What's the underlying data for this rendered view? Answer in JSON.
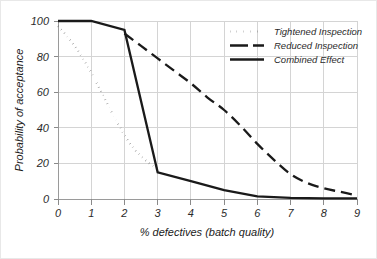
{
  "chart_data": {
    "type": "line",
    "title": "",
    "xlabel": "% defectives (batch quality)",
    "ylabel": "Probability of acceptance",
    "xlim": [
      0,
      9
    ],
    "ylim": [
      0,
      100
    ],
    "xticks": [
      "0",
      "1",
      "2",
      "3",
      "4",
      "5",
      "6",
      "7",
      "8",
      "9"
    ],
    "yticks": [
      "0",
      "20",
      "40",
      "60",
      "80",
      "100"
    ],
    "grid": true,
    "legend_position": "top-right",
    "series": [
      {
        "name": "Tightened Inspection",
        "style": "dotted",
        "x": [
          0,
          0.25,
          0.5,
          0.75,
          1,
          1.25,
          1.5,
          1.75,
          2,
          2.25,
          2.5,
          2.75,
          3
        ],
        "values": [
          97,
          92,
          86,
          79,
          71,
          62,
          53,
          44,
          36,
          29,
          24,
          20,
          17
        ]
      },
      {
        "name": "Reduced Inspection",
        "style": "dashed",
        "x": [
          2,
          2.5,
          3,
          3.5,
          4,
          4.5,
          5,
          5.5,
          6,
          6.5,
          7,
          7.5,
          8,
          8.5,
          9
        ],
        "values": [
          93,
          86,
          79,
          72,
          65,
          57,
          50,
          41,
          31,
          22,
          14,
          9,
          6,
          4,
          2
        ]
      },
      {
        "name": "Combined Effect",
        "style": "solid",
        "x": [
          0,
          1,
          2,
          3,
          4,
          5,
          6,
          7,
          8,
          9
        ],
        "values": [
          100,
          100,
          95,
          15,
          10,
          5,
          1.5,
          0.6,
          0.4,
          0.3
        ]
      }
    ],
    "colors": {
      "series_line": "#1a1a1a",
      "gridline": "#d4d4d4",
      "axis": "#9a9a9a",
      "background": "#ffffff"
    }
  },
  "legend": {
    "items": [
      {
        "label": "Tightened Inspection",
        "style": "dotted"
      },
      {
        "label": "Reduced Inspection",
        "style": "dashed"
      },
      {
        "label": "Combined Effect",
        "style": "solid"
      }
    ]
  }
}
